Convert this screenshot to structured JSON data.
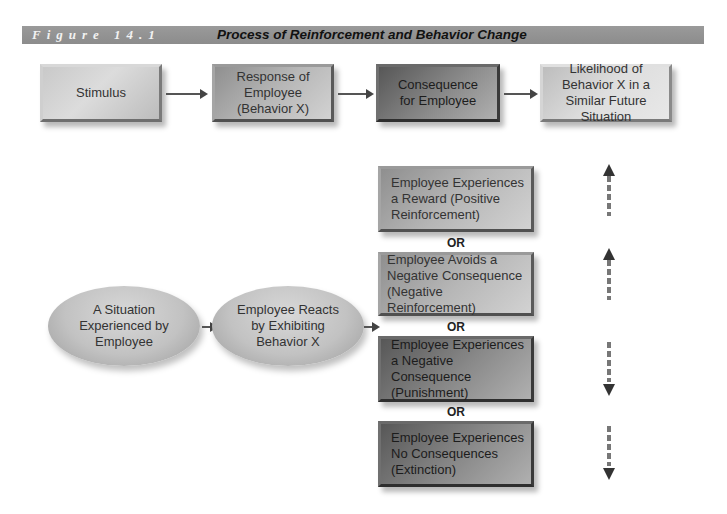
{
  "header": {
    "figure_label": "Figure 14.1",
    "title": "Process of Reinforcement and Behavior Change"
  },
  "top_row": [
    {
      "label": "Stimulus"
    },
    {
      "label": "Response of Employee (Behavior X)"
    },
    {
      "label": "Consequence for Employee"
    },
    {
      "label": "Likelihood of Behavior X in a Similar Future Situation"
    }
  ],
  "flow": [
    {
      "label": "A Situation Experienced by Employee"
    },
    {
      "label": "Employee Reacts by Exhibiting Behavior X"
    }
  ],
  "consequences": [
    {
      "label": "Employee Experiences a Reward (Positive Reinforcement)",
      "likelihood": "increase"
    },
    {
      "label": "Employee Avoids a Negative Consequence (Negative Reinforcement)",
      "likelihood": "increase"
    },
    {
      "label": "Employee Experiences a Negative Consequence (Punishment)",
      "likelihood": "decrease"
    },
    {
      "label": "Employee Experiences No Consequences (Extinction)",
      "likelihood": "decrease"
    }
  ],
  "separator": "OR"
}
